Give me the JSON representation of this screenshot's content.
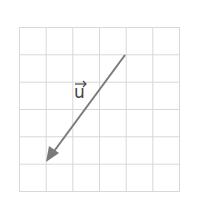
{
  "diagram": {
    "type": "vector-on-grid",
    "grid": {
      "columns": 6,
      "rows": 6,
      "line_color": "#d8d8d8"
    },
    "vector": {
      "label": "u",
      "label_text": "u",
      "start_cell": [
        4,
        1
      ],
      "end_cell": [
        1,
        5
      ],
      "color": "#7a7a7a"
    }
  }
}
